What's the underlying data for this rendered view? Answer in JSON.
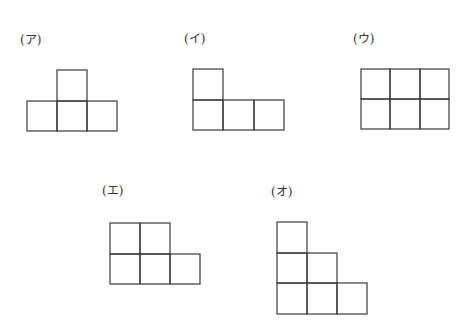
{
  "figures": [
    {
      "label": "(ア)",
      "shape": "T-tetromino",
      "cells": [
        [
          1,
          0
        ],
        [
          0,
          1
        ],
        [
          1,
          1
        ],
        [
          2,
          1
        ]
      ]
    },
    {
      "label": "(イ)",
      "shape": "L-tetromino",
      "cells": [
        [
          0,
          0
        ],
        [
          0,
          1
        ],
        [
          1,
          1
        ],
        [
          2,
          1
        ]
      ]
    },
    {
      "label": "(ウ)",
      "shape": "3x2 rectangle",
      "cells": [
        [
          0,
          0
        ],
        [
          1,
          0
        ],
        [
          2,
          0
        ],
        [
          0,
          1
        ],
        [
          1,
          1
        ],
        [
          2,
          1
        ]
      ]
    },
    {
      "label": "(エ)",
      "shape": "P-pentomino",
      "cells": [
        [
          0,
          0
        ],
        [
          1,
          0
        ],
        [
          0,
          1
        ],
        [
          1,
          1
        ],
        [
          2,
          1
        ]
      ]
    },
    {
      "label": "(オ)",
      "shape": "staircase",
      "cells": [
        [
          0,
          0
        ],
        [
          0,
          1
        ],
        [
          1,
          1
        ],
        [
          0,
          2
        ],
        [
          1,
          2
        ],
        [
          2,
          2
        ]
      ]
    }
  ],
  "colors": {
    "stroke": "#3a3a3a",
    "background": "#ffffff"
  }
}
